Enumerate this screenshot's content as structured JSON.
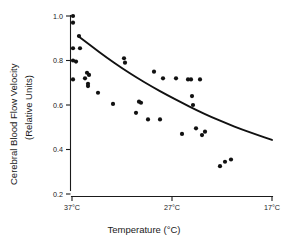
{
  "chart_data": {
    "type": "scatter",
    "title": "",
    "xlabel": "Temperature (°C)",
    "ylabel": "Cerebral Blood Flow Velocity (Relative Units)",
    "ylabel_line1": "Cerebral Blood Flow Velocity",
    "ylabel_line2": "(Relative Units)",
    "x_tick_labels": [
      "37°C",
      "27°C",
      "17°C"
    ],
    "x_tick_values": [
      37,
      27,
      17
    ],
    "y_tick_labels": [
      "0.2",
      "0.4",
      "0.6",
      "0.8",
      "1.0"
    ],
    "y_tick_values": [
      0.2,
      0.4,
      0.6,
      0.8,
      1.0
    ],
    "xlim": [
      37,
      17
    ],
    "ylim": [
      0.2,
      1.0
    ],
    "x_axis_direction": "decreasing",
    "grid": false,
    "legend": null,
    "marker": "filled-circle",
    "marker_color": "#111111",
    "curve_color": "#111111",
    "points": [
      {
        "x": 36.9,
        "y": 1.0
      },
      {
        "x": 36.9,
        "y": 0.97
      },
      {
        "x": 36.9,
        "y": 0.855
      },
      {
        "x": 36.9,
        "y": 0.8
      },
      {
        "x": 36.9,
        "y": 0.715
      },
      {
        "x": 36.6,
        "y": 0.795
      },
      {
        "x": 36.3,
        "y": 0.91
      },
      {
        "x": 36.2,
        "y": 0.855
      },
      {
        "x": 35.7,
        "y": 0.72
      },
      {
        "x": 35.5,
        "y": 0.745
      },
      {
        "x": 35.4,
        "y": 0.695
      },
      {
        "x": 35.4,
        "y": 0.685
      },
      {
        "x": 35.3,
        "y": 0.735
      },
      {
        "x": 34.4,
        "y": 0.655
      },
      {
        "x": 32.9,
        "y": 0.605
      },
      {
        "x": 31.8,
        "y": 0.81
      },
      {
        "x": 31.7,
        "y": 0.79
      },
      {
        "x": 30.6,
        "y": 0.565
      },
      {
        "x": 30.3,
        "y": 0.615
      },
      {
        "x": 30.1,
        "y": 0.61
      },
      {
        "x": 29.4,
        "y": 0.535
      },
      {
        "x": 28.8,
        "y": 0.75
      },
      {
        "x": 28.2,
        "y": 0.535
      },
      {
        "x": 27.9,
        "y": 0.72
      },
      {
        "x": 26.6,
        "y": 0.72
      },
      {
        "x": 26.0,
        "y": 0.47
      },
      {
        "x": 25.4,
        "y": 0.715
      },
      {
        "x": 25.1,
        "y": 0.715
      },
      {
        "x": 25.0,
        "y": 0.64
      },
      {
        "x": 24.9,
        "y": 0.6
      },
      {
        "x": 24.6,
        "y": 0.495
      },
      {
        "x": 24.2,
        "y": 0.715
      },
      {
        "x": 24.0,
        "y": 0.465
      },
      {
        "x": 23.7,
        "y": 0.48
      },
      {
        "x": 22.2,
        "y": 0.325
      },
      {
        "x": 21.7,
        "y": 0.345
      },
      {
        "x": 21.1,
        "y": 0.355
      }
    ],
    "fit_curve": [
      {
        "x": 36.4,
        "y": 0.91
      },
      {
        "x": 35.0,
        "y": 0.862
      },
      {
        "x": 33.5,
        "y": 0.812
      },
      {
        "x": 32.0,
        "y": 0.765
      },
      {
        "x": 30.5,
        "y": 0.722
      },
      {
        "x": 29.0,
        "y": 0.682
      },
      {
        "x": 27.5,
        "y": 0.645
      },
      {
        "x": 26.0,
        "y": 0.61
      },
      {
        "x": 24.5,
        "y": 0.576
      },
      {
        "x": 23.0,
        "y": 0.545
      },
      {
        "x": 21.5,
        "y": 0.516
      },
      {
        "x": 20.0,
        "y": 0.49
      },
      {
        "x": 18.5,
        "y": 0.466
      },
      {
        "x": 17.0,
        "y": 0.443
      }
    ]
  }
}
